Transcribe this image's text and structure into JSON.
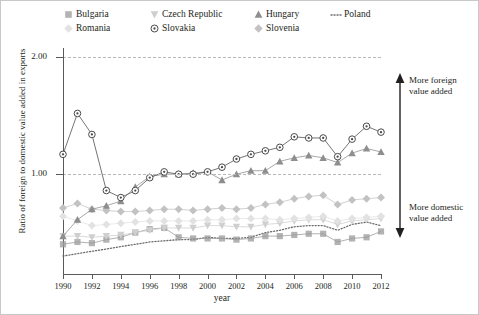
{
  "legend": {
    "entries": [
      {
        "label": "Bulgaria",
        "marker": "open-square",
        "color": "#9a9a9a",
        "row": 0,
        "col": 0
      },
      {
        "label": "Czech Republic",
        "marker": "down-triangle",
        "color": "#cfcfcf",
        "row": 0,
        "col": 1
      },
      {
        "label": "Hungary",
        "marker": "up-triangle",
        "color": "#8e8e8e",
        "row": 0,
        "col": 2
      },
      {
        "label": "Poland",
        "marker": "dotted-line",
        "color": "#6b6b6b",
        "row": 0,
        "col": 3
      },
      {
        "label": "Romania",
        "marker": "open-diamond",
        "color": "#e2e2e2",
        "row": 1,
        "col": 0
      },
      {
        "label": "Slovakia",
        "marker": "circle-dot",
        "color": "#4a4a4a",
        "row": 1,
        "col": 1
      },
      {
        "label": "Slovenia",
        "marker": "open-diamond",
        "color": "#c2c2c2",
        "row": 1,
        "col": 2
      }
    ]
  },
  "axes": {
    "ylabel": "Ratio of foreign to domestic value added in exports",
    "xlabel": "year",
    "yticks": [
      "1.00",
      "2.00"
    ],
    "ytick_values": [
      1.0,
      2.0
    ],
    "xticks": [
      "1990",
      "1992",
      "1994",
      "1996",
      "1998",
      "2000",
      "2002",
      "2004",
      "2006",
      "2008",
      "2010",
      "2012"
    ]
  },
  "annotations": {
    "top_line1": "More foreign",
    "top_line2": "value added",
    "bottom_line1": "More domestic",
    "bottom_line2": "value added"
  },
  "chart_data": {
    "type": "line",
    "title": "",
    "xlabel": "year",
    "ylabel": "Ratio of foreign to domestic value added in exports",
    "xlim": [
      1990,
      2012
    ],
    "ylim": [
      0.18,
      2.08
    ],
    "grid": true,
    "gridlines": [
      1.0,
      2.0
    ],
    "legend_position": "top",
    "x": [
      1990,
      1991,
      1992,
      1993,
      1994,
      1995,
      1996,
      1997,
      1998,
      1999,
      2000,
      2001,
      2002,
      2003,
      2004,
      2005,
      2006,
      2007,
      2008,
      2009,
      2010,
      2011,
      2012
    ],
    "series": [
      {
        "name": "Slovakia",
        "color": "#4a4a4a",
        "marker": "circle-dot",
        "values": [
          1.17,
          1.52,
          1.34,
          0.86,
          0.8,
          0.86,
          0.97,
          1.02,
          1.0,
          1.0,
          1.02,
          1.06,
          1.13,
          1.17,
          1.2,
          1.23,
          1.32,
          1.31,
          1.31,
          1.15,
          1.3,
          1.41,
          1.36
        ]
      },
      {
        "name": "Hungary",
        "color": "#8e8e8e",
        "marker": "up-triangle",
        "values": [
          0.47,
          0.61,
          0.7,
          0.73,
          0.77,
          0.89,
          0.98,
          1.0,
          1.0,
          1.01,
          1.02,
          0.95,
          1.0,
          1.03,
          1.03,
          1.11,
          1.14,
          1.16,
          1.14,
          1.1,
          1.18,
          1.22,
          1.19
        ]
      },
      {
        "name": "Slovenia",
        "color": "#c2c2c2",
        "marker": "open-diamond",
        "values": [
          0.71,
          0.75,
          0.7,
          0.69,
          0.68,
          0.68,
          0.69,
          0.7,
          0.7,
          0.69,
          0.7,
          0.71,
          0.7,
          0.71,
          0.74,
          0.76,
          0.79,
          0.81,
          0.82,
          0.74,
          0.78,
          0.79,
          0.8
        ]
      },
      {
        "name": "Romania",
        "color": "#e2e2e2",
        "marker": "open-diamond",
        "values": [
          0.64,
          0.6,
          0.56,
          0.57,
          0.58,
          0.59,
          0.6,
          0.6,
          0.6,
          0.6,
          0.61,
          0.61,
          0.62,
          0.62,
          0.62,
          0.61,
          0.62,
          0.63,
          0.64,
          0.6,
          0.62,
          0.63,
          0.64
        ]
      },
      {
        "name": "Czech Republic",
        "color": "#cfcfcf",
        "marker": "down-triangle",
        "values": [
          0.47,
          0.47,
          0.46,
          0.47,
          0.48,
          0.5,
          0.52,
          0.54,
          0.54,
          0.54,
          0.56,
          0.56,
          0.55,
          0.55,
          0.57,
          0.58,
          0.6,
          0.61,
          0.61,
          0.57,
          0.6,
          0.61,
          0.62
        ]
      },
      {
        "name": "Bulgaria",
        "color": "#9a9a9a",
        "marker": "open-square",
        "values": [
          0.4,
          0.42,
          0.41,
          0.44,
          0.46,
          0.5,
          0.53,
          0.54,
          0.46,
          0.45,
          0.45,
          0.45,
          0.44,
          0.45,
          0.47,
          0.47,
          0.48,
          0.49,
          0.49,
          0.42,
          0.45,
          0.46,
          0.51
        ]
      },
      {
        "name": "Poland",
        "color": "#6b6b6b",
        "marker": "dotted-line",
        "values": [
          0.3,
          0.32,
          0.34,
          0.36,
          0.38,
          0.4,
          0.42,
          0.43,
          0.44,
          0.44,
          0.46,
          0.45,
          0.45,
          0.46,
          0.5,
          0.52,
          0.55,
          0.56,
          0.56,
          0.52,
          0.57,
          0.59,
          0.56
        ]
      }
    ]
  }
}
